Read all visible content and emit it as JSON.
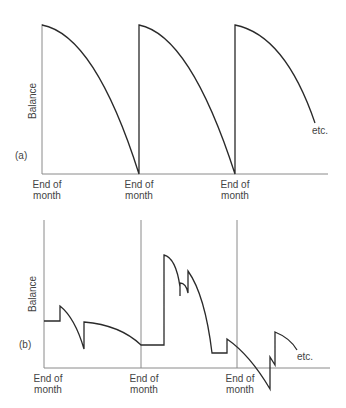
{
  "panels": [
    {
      "id": "a",
      "tag": "(a)",
      "y_label": "Balance",
      "x_labels": [
        "End of month",
        "End of month",
        "End of month"
      ],
      "x_label_lines": [
        [
          "End of",
          "month"
        ],
        [
          "End of",
          "month"
        ],
        [
          "End of",
          "month"
        ]
      ],
      "continuation": "etc.",
      "description": "Sawtooth: balance starts at maximum at each end of month and declines along a concave curve to zero by the next end of month, then jumps back to maximum."
    },
    {
      "id": "b",
      "tag": "(b)",
      "y_label": "Balance",
      "x_labels": [
        "End of month",
        "End of month",
        "End of month"
      ],
      "x_label_lines": [
        [
          "End of",
          "month"
        ],
        [
          "End of",
          "month"
        ],
        [
          "End of",
          "month"
        ]
      ],
      "continuation": "etc.",
      "description": "Irregular balance: flat segments, jumps up on receipts, curved declines on spending, dipping below zero (overdraft) after the third end of month."
    }
  ],
  "colors": {
    "line": "#2a2a2a",
    "axis": "#8a8a8a",
    "text": "#444444"
  }
}
